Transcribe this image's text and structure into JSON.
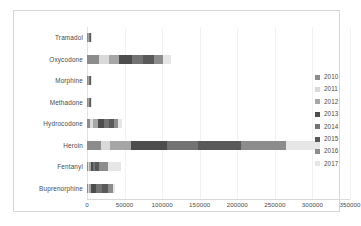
{
  "chart_data": {
    "type": "bar",
    "orientation": "horizontal",
    "stacked": true,
    "title": "",
    "xlabel": "",
    "ylabel": "",
    "xlim": [
      0,
      350000
    ],
    "xticks": [
      0,
      50000,
      100000,
      150000,
      200000,
      250000,
      300000,
      350000
    ],
    "xtick_labels": [
      "0",
      "50000",
      "100000",
      "150000",
      "200000",
      "250000",
      "300000",
      "350000"
    ],
    "grid": true,
    "grid_axis": "x",
    "legend_position": "right",
    "categories": [
      "Tramadol",
      "Oxycodone",
      "Morphine",
      "Methadone",
      "Hydrocodone",
      "Heroin",
      "Fentanyl",
      "Buprenorphine"
    ],
    "series": [
      {
        "name": "2010",
        "color": "#8c8c8c",
        "values": [
          300,
          16000,
          600,
          600,
          4000,
          18000,
          1500,
          1200
        ]
      },
      {
        "name": "2011",
        "color": "#d9d9d9",
        "values": [
          300,
          13000,
          600,
          500,
          4500,
          13000,
          1500,
          1500
        ]
      },
      {
        "name": "2012",
        "color": "#a6a6a6",
        "values": [
          400,
          14000,
          700,
          600,
          5500,
          27000,
          2000,
          3000
        ]
      },
      {
        "name": "2013",
        "color": "#4d4d4d",
        "values": [
          400,
          17000,
          700,
          600,
          8500,
          48000,
          2500,
          6500
        ]
      },
      {
        "name": "2014",
        "color": "#737373",
        "values": [
          400,
          15000,
          700,
          600,
          6500,
          42000,
          3500,
          7500
        ]
      },
      {
        "name": "2015",
        "color": "#595959",
        "values": [
          400,
          14000,
          700,
          600,
          6500,
          57000,
          5500,
          8000
        ]
      },
      {
        "name": "2016",
        "color": "#8c8c8c",
        "values": [
          400,
          12000,
          700,
          600,
          6000,
          60000,
          12000,
          6500
        ]
      },
      {
        "name": "2017",
        "color": "#e6e6e6",
        "values": [
          400,
          11000,
          700,
          600,
          5500,
          45000,
          16500,
          3800
        ]
      }
    ],
    "totals": [
      3000,
      112000,
      5400,
      4700,
      47000,
      310000,
      45000,
      38000
    ]
  }
}
